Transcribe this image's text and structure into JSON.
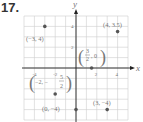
{
  "problem": {
    "number": "17."
  },
  "chart_data": {
    "type": "scatter",
    "title": "",
    "xlabel": "x",
    "ylabel": "y",
    "xlim": [
      -5,
      5
    ],
    "ylim": [
      -5,
      5
    ],
    "grid": true,
    "x_ticks": [
      {
        "value": -4,
        "label": "-4"
      },
      {
        "value": -2,
        "label": "-2"
      },
      {
        "value": 2,
        "label": "2"
      },
      {
        "value": 4,
        "label": "4"
      }
    ],
    "y_ticks": [
      {
        "value": 2,
        "label": "2"
      },
      {
        "value": 4,
        "label": "4"
      }
    ],
    "points": [
      {
        "x": -3,
        "y": 4,
        "label": "(−3, 4)"
      },
      {
        "x": 4,
        "y": 3.5,
        "label": "(4, 3.5)"
      },
      {
        "x": 1.5,
        "y": 0,
        "label": "(3/2, 0)"
      },
      {
        "x": -2,
        "y": -2.5,
        "label": "(−2, −5/2)"
      },
      {
        "x": 0,
        "y": -4,
        "label": "(0, −4)"
      },
      {
        "x": 3,
        "y": -4,
        "label": "(3, −4)"
      }
    ],
    "colors": {
      "points": "#555555",
      "grid": "#cccccc",
      "axes": "#222222",
      "labels": "#777777"
    }
  }
}
